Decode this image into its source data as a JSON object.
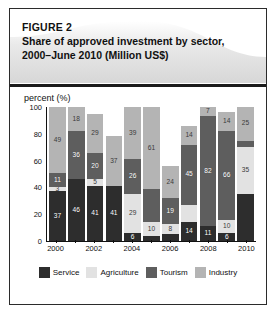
{
  "figure": {
    "label": "FIGURE 2",
    "title_line1": "Share of approved investment by sector,",
    "title_line2": "2000–June 2010 (Million US$)"
  },
  "chart_data": {
    "type": "bar",
    "subtype": "stacked-percentage-column",
    "title": "Share of approved investment by sector, 2000–June 2010 (Million US$)",
    "xlabel": "",
    "ylabel": "percent (%)",
    "ylim": [
      0,
      100
    ],
    "yticks": [
      0,
      20,
      40,
      60,
      80,
      100
    ],
    "grid": false,
    "legend_position": "bottom",
    "categories": [
      "2000",
      "2001",
      "2002",
      "2003",
      "2004",
      "2005",
      "2006",
      "2007",
      "2008",
      "2009",
      "2010"
    ],
    "xtick_labels": [
      "2000",
      "",
      "2002",
      "",
      "2004",
      "",
      "2006",
      "",
      "2008",
      "",
      "2010"
    ],
    "stack_order_bottom_to_top": [
      "Service",
      "Agriculture",
      "Tourism",
      "Industry"
    ],
    "series": [
      {
        "name": "Service",
        "color": "#2d2d2d",
        "values": [
          37,
          46,
          41,
          41,
          6,
          4,
          5,
          14,
          11,
          6,
          35
        ],
        "labels": [
          "37",
          "46",
          "41",
          "41",
          "6",
          "",
          "",
          "14",
          "11",
          "6",
          ""
        ]
      },
      {
        "name": "Agriculture",
        "color": "#e2e2e2",
        "values": [
          3,
          0,
          5,
          0,
          29,
          10,
          8,
          13,
          0,
          10,
          35
        ],
        "labels": [
          "3",
          "",
          "5",
          "",
          "29",
          "10",
          "8",
          "",
          "",
          "10",
          "35"
        ]
      },
      {
        "name": "Tourism",
        "color": "#5e5e5e",
        "values": [
          11,
          36,
          20,
          0,
          26,
          25,
          19,
          45,
          82,
          66,
          5
        ],
        "labels": [
          "11",
          "36",
          "20",
          "",
          "26",
          "",
          "19",
          "45",
          "82",
          "66",
          ""
        ]
      },
      {
        "name": "Industry",
        "color": "#b4b4b4",
        "values": [
          49,
          18,
          29,
          37,
          39,
          61,
          24,
          14,
          7,
          14,
          25
        ],
        "labels": [
          "49",
          "18",
          "29",
          "37",
          "39",
          "61",
          "24",
          "14",
          "7",
          "14",
          "25"
        ]
      }
    ]
  },
  "legend": {
    "items": [
      {
        "label": "Service",
        "color": "#2d2d2d"
      },
      {
        "label": "Agriculture",
        "color": "#e2e2e2"
      },
      {
        "label": "Tourism",
        "color": "#5e5e5e"
      },
      {
        "label": "Industry",
        "color": "#b4b4b4"
      }
    ]
  }
}
